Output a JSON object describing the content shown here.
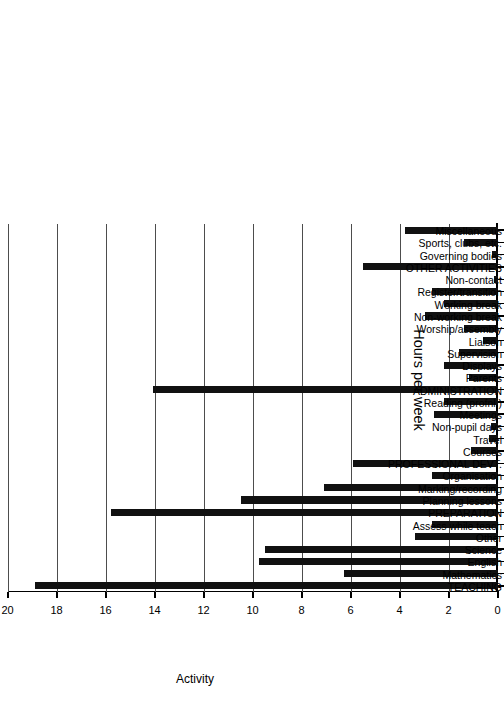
{
  "chart_data": {
    "type": "bar",
    "title": "",
    "orientation": "vertical-bars-rotated-90",
    "xlabel": "Activity",
    "ylabel": "Hours per week",
    "ylim": [
      0,
      20
    ],
    "yticks": [
      0,
      2,
      4,
      6,
      8,
      10,
      12,
      14,
      16,
      18,
      20
    ],
    "grid": true,
    "legend": null,
    "bar_color": "#111111",
    "categories": [
      "TEACHING",
      "Mathematics",
      "English",
      "Science",
      "Other",
      "Assess while teach",
      "PREPARATION",
      "Planning lessons",
      "Marking/recording",
      "Organisation",
      "PROFESSIONAL DEVT.",
      "Courses",
      "Travel",
      "Non-pupil days",
      "Meetings",
      "Reading (profnl.)",
      "ADMINISTRATION",
      "Parents",
      "Displays",
      "Supervision",
      "Liaison",
      "Worship/assembly",
      "Non-working break",
      "Working break",
      "Register/transition",
      "Non-contact",
      "OTHER ACTIVITIES",
      "Governing bodies",
      "Sports, clubs, etc.",
      "Miscellaneous"
    ],
    "values": [
      18.9,
      6.3,
      9.75,
      9.5,
      3.4,
      2.7,
      15.8,
      10.5,
      7.1,
      2.7,
      5.9,
      1.1,
      0.35,
      0.3,
      2.6,
      2.2,
      14.1,
      1.2,
      2.2,
      1.6,
      0.6,
      1.4,
      3.0,
      2.2,
      2.7,
      0.15,
      5.5,
      0.25,
      1.4,
      3.8
    ]
  }
}
